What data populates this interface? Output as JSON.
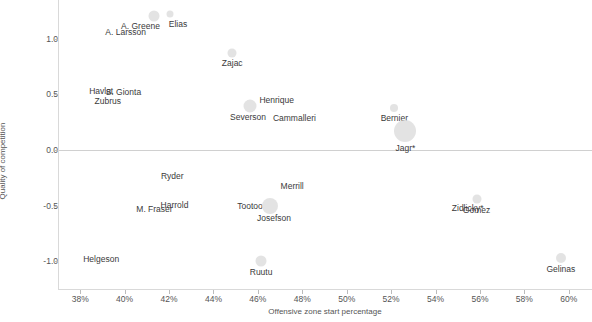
{
  "chart_data": {
    "type": "scatter",
    "title": "",
    "xlabel": "Offensive zone start percentage",
    "ylabel": "Quality of competition",
    "xlim": [
      37.0,
      61.0
    ],
    "ylim": [
      -1.25,
      1.35
    ],
    "xticks": [
      "38%",
      "40%",
      "42%",
      "44%",
      "46%",
      "48%",
      "50%",
      "52%",
      "54%",
      "56%",
      "58%",
      "60%"
    ],
    "xtick_values": [
      38,
      40,
      42,
      44,
      46,
      48,
      50,
      52,
      54,
      56,
      58,
      60
    ],
    "yticks": [
      "1.0",
      "0.5",
      "0.0",
      "-0.5",
      "-1.0"
    ],
    "ytick_values": [
      1.0,
      0.5,
      0.0,
      -0.5,
      -1.0
    ],
    "grid": false,
    "legend": "none",
    "zero_reference_line": 0.0,
    "bubble_size_meaning": "ice time",
    "points": [
      {
        "label": "A. Greene",
        "x": 41.3,
        "y": 1.21,
        "size": 11,
        "label_dx": -14,
        "label_dy": 10
      },
      {
        "label": "Elias",
        "x": 42.0,
        "y": 1.22,
        "size": 7,
        "label_dx": 8,
        "label_dy": 10
      },
      {
        "label": "A. Larsson",
        "x": 40.0,
        "y": 1.06,
        "size": 0,
        "label_dx": 0,
        "label_dy": 0
      },
      {
        "label": "Zajac",
        "x": 44.8,
        "y": 0.87,
        "size": 9,
        "label_dx": 0,
        "label_dy": 10
      },
      {
        "label": "Havlat",
        "x": 38.9,
        "y": 0.53,
        "size": 0,
        "label_dx": 0,
        "label_dy": 0
      },
      {
        "label": "S. Gionta",
        "x": 39.9,
        "y": 0.52,
        "size": 0,
        "label_dx": 0,
        "label_dy": 0
      },
      {
        "label": "Zubrus",
        "x": 39.2,
        "y": 0.44,
        "size": 0,
        "label_dx": 0,
        "label_dy": 0
      },
      {
        "label": "Henrique",
        "x": 46.8,
        "y": 0.45,
        "size": 0,
        "label_dx": 0,
        "label_dy": 0
      },
      {
        "label": "Severson",
        "x": 45.6,
        "y": 0.4,
        "size": 13,
        "label_dx": -2,
        "label_dy": 11
      },
      {
        "label": "Cammalleri",
        "x": 47.6,
        "y": 0.29,
        "size": 0,
        "label_dx": 0,
        "label_dy": 0
      },
      {
        "label": "Bernier",
        "x": 52.1,
        "y": 0.38,
        "size": 8,
        "label_dx": 0,
        "label_dy": 10
      },
      {
        "label": "Jagr*",
        "x": 52.6,
        "y": 0.17,
        "size": 22,
        "label_dx": 0,
        "label_dy": 17
      },
      {
        "label": "Ryder",
        "x": 42.1,
        "y": -0.23,
        "size": 0,
        "label_dx": 0,
        "label_dy": 0
      },
      {
        "label": "Merrill",
        "x": 47.5,
        "y": -0.32,
        "size": 0,
        "label_dx": 0,
        "label_dy": 0
      },
      {
        "label": "Gomez",
        "x": 55.8,
        "y": -0.44,
        "size": 9,
        "label_dx": 0,
        "label_dy": 11
      },
      {
        "label": "Zidlicky*",
        "x": 55.4,
        "y": -0.52,
        "size": 0,
        "label_dx": 0,
        "label_dy": 0
      },
      {
        "label": "M. Fraser",
        "x": 41.3,
        "y": -0.53,
        "size": 0,
        "label_dx": 0,
        "label_dy": 0
      },
      {
        "label": "Harrold",
        "x": 42.2,
        "y": -0.49,
        "size": 0,
        "label_dx": 0,
        "label_dy": 0
      },
      {
        "label": "Tootoo",
        "x": 45.6,
        "y": -0.5,
        "size": 0,
        "label_dx": 0,
        "label_dy": 0
      },
      {
        "label": "Josefson",
        "x": 46.5,
        "y": -0.5,
        "size": 16,
        "label_dx": 4,
        "label_dy": 12
      },
      {
        "label": "Helgeson",
        "x": 38.9,
        "y": -0.98,
        "size": 0,
        "label_dx": 0,
        "label_dy": 0
      },
      {
        "label": "Ruutu",
        "x": 46.1,
        "y": -1.0,
        "size": 11,
        "label_dx": 0,
        "label_dy": 11
      },
      {
        "label": "Gelinas",
        "x": 59.6,
        "y": -0.97,
        "size": 10,
        "label_dx": 0,
        "label_dy": 11
      }
    ]
  },
  "colors": {
    "bubble": "#dedede",
    "axis": "#d9d9d9",
    "text": "#3a3a3a",
    "tick_text": "#555555"
  }
}
